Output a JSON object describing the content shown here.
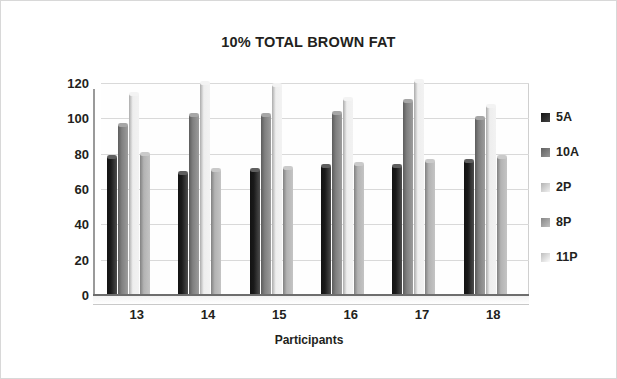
{
  "chart_data": {
    "type": "bar",
    "title": "10% TOTAL BROWN FAT",
    "xlabel": "Participants",
    "ylabel": "Blood Glucose",
    "categories": [
      "13",
      "14",
      "15",
      "16",
      "17",
      "18"
    ],
    "ylim": [
      0,
      120
    ],
    "yticks": [
      120,
      100,
      80,
      60,
      40,
      20,
      0
    ],
    "grid": true,
    "legend_position": "right",
    "series": [
      {
        "name": "5A",
        "color": "#1a1a1a",
        "values": [
          78,
          69,
          71,
          73,
          73,
          76
        ]
      },
      {
        "name": "10A",
        "color": "#808080",
        "values": [
          96,
          102,
          102,
          103,
          110,
          100
        ]
      },
      {
        "name": "2P",
        "color": "#eeeeee",
        "values": [
          114,
          120,
          119,
          111,
          121,
          107
        ]
      },
      {
        "name": "8P",
        "color": "#b3b3b3",
        "values": [
          80,
          71,
          72,
          74,
          76,
          78
        ]
      },
      {
        "name": "11P",
        "color": "#fdfdfd",
        "values": [
          0,
          0,
          0,
          0,
          0,
          0
        ]
      }
    ]
  },
  "legend": {
    "items": [
      {
        "label": "5A"
      },
      {
        "label": "10A"
      },
      {
        "label": "2P"
      },
      {
        "label": "8P"
      },
      {
        "label": "11P"
      }
    ]
  },
  "colors": {
    "axis": "#6d6d6d",
    "grid": "#d9d9d9",
    "text": "#231f20",
    "background": "#ffffff",
    "frame": "#d8d8d8"
  }
}
